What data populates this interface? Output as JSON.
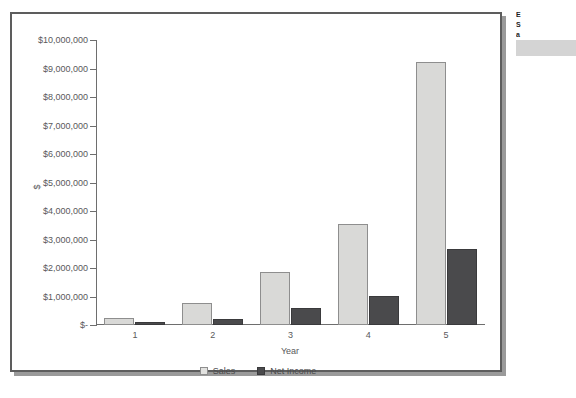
{
  "chart_data": {
    "type": "bar",
    "title": "",
    "xlabel": "Year",
    "ylabel": "$",
    "categories": [
      "1",
      "2",
      "3",
      "4",
      "5"
    ],
    "series": [
      {
        "name": "Sales",
        "color": "#d9d9d7",
        "values": [
          250000,
          760000,
          1860000,
          3550000,
          9230000
        ]
      },
      {
        "name": "Net Income",
        "color": "#4a4a4c",
        "values": [
          100000,
          220000,
          580000,
          1010000,
          2650000
        ]
      }
    ],
    "ylim": [
      0,
      10000000
    ],
    "ytick_values": [
      0,
      1000000,
      2000000,
      3000000,
      4000000,
      5000000,
      6000000,
      7000000,
      8000000,
      9000000,
      10000000
    ],
    "ytick_labels": [
      "$-",
      "$1,000,000",
      "$2,000,000",
      "$3,000,000",
      "$4,000,000",
      "$5,000,000",
      "$6,000,000",
      "$7,000,000",
      "$8,000,000",
      "$9,000,000",
      "$10,000,000"
    ],
    "grid": false,
    "legend_position": "bottom"
  },
  "legend": {
    "items": [
      {
        "label": "Sales"
      },
      {
        "label": "Net Income"
      }
    ]
  },
  "side_caption": {
    "line1": "E",
    "line2": "S",
    "line3": "a"
  }
}
